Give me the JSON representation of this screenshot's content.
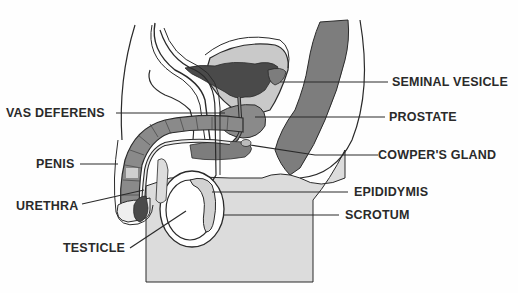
{
  "diagram": {
    "labels": {
      "seminal_vesicle": "SEMINAL VESICLE",
      "vas_deferens": "VAS DEFERENS",
      "prostate": "PROSTATE",
      "cowpers_gland": "COWPER'S GLAND",
      "penis": "PENIS",
      "epididymis": "EPIDIDYMIS",
      "urethra": "URETHRA",
      "scrotum": "SCROTUM",
      "testicle": "TESTICLE"
    },
    "colors": {
      "background": "#fefefe",
      "outline": "#2a2a2a",
      "dark_fill": "#4a4a4a",
      "mid_fill": "#7d7d7d",
      "light_fill": "#c9c9c9",
      "skin_fill": "#dcdcdc",
      "label_text": "#2a2a2a"
    }
  }
}
